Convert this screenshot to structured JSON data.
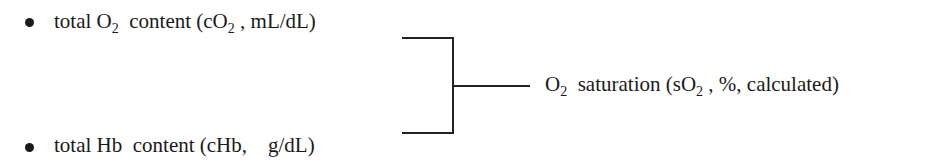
{
  "inputs": [
    {
      "prefix": "total O",
      "prefix_sub": "2",
      "mid": "  content (cO",
      "mid_sub": "2",
      "suffix": " , mL/dL)"
    },
    {
      "prefix": "total Hb  content (cHb,    g/dL)"
    }
  ],
  "output": {
    "prefix": "O",
    "prefix_sub": "2",
    "mid": "  saturation (sO",
    "mid_sub": "2",
    "suffix": " , %, calculated)"
  },
  "colors": {
    "text": "#1a1a1a",
    "line": "#222222",
    "background": "#ffffff"
  }
}
